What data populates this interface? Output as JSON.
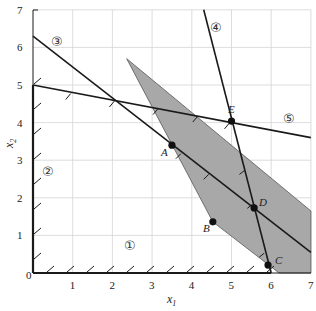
{
  "chart_data": {
    "type": "line",
    "title": "",
    "xlabel": "x",
    "xlabel_sub": "1",
    "ylabel": "x",
    "ylabel_sub": "2",
    "xlim": [
      0,
      7
    ],
    "ylim": [
      0,
      7
    ],
    "grid": true,
    "x_ticks": [
      "0",
      "1",
      "2",
      "3",
      "4",
      "5",
      "6",
      "7"
    ],
    "y_ticks": [
      "1",
      "2",
      "3",
      "4",
      "5",
      "6",
      "7"
    ],
    "constraints": [
      {
        "label": "①",
        "from": [
          0,
          0
        ],
        "to": [
          6,
          0
        ],
        "hatched_side": "above"
      },
      {
        "label": "②",
        "from": [
          0,
          0
        ],
        "to": [
          0,
          5
        ],
        "hatched_side": "right"
      },
      {
        "label": "③",
        "from": [
          0,
          6.3
        ],
        "to": [
          7,
          0.55
        ]
      },
      {
        "label": "④",
        "from": [
          4.3,
          7
        ],
        "to": [
          6,
          0
        ]
      },
      {
        "label": "⑤",
        "from": [
          0,
          5
        ],
        "to": [
          7,
          3.6
        ],
        "hatched_side": "below"
      }
    ],
    "shaded_region": [
      [
        2.36,
        5.7
      ],
      [
        7,
        1.65
      ],
      [
        7,
        0
      ],
      [
        6.2,
        0
      ],
      [
        4.53,
        1.36
      ]
    ],
    "points": [
      {
        "label": "A",
        "x": 3.5,
        "y": 3.4
      },
      {
        "label": "B",
        "x": 4.53,
        "y": 1.36
      },
      {
        "label": "C",
        "x": 5.92,
        "y": 0.21
      },
      {
        "label": "D",
        "x": 5.57,
        "y": 1.73
      },
      {
        "label": "E",
        "x": 5.0,
        "y": 4.04
      }
    ],
    "region_labels": [
      {
        "label": "①",
        "x": 2.5,
        "y": 0.6
      },
      {
        "label": "②",
        "x": 0.35,
        "y": 2.7
      },
      {
        "label": "③",
        "x": 0.65,
        "y": 6.1
      },
      {
        "label": "④",
        "x": 5.0,
        "y": 6.7
      },
      {
        "label": "⑤",
        "x": 6.4,
        "y": 4.0
      }
    ]
  },
  "labels": {
    "x_axis": "x",
    "x_axis_sub": "1",
    "y_axis": "x",
    "y_axis_sub": "2",
    "origin": "0",
    "point_a": "A",
    "point_b": "B",
    "point_c": "C",
    "point_d": "D",
    "point_e": "E",
    "c1": "①",
    "c2": "②",
    "c3": "③",
    "c4": "④",
    "c5": "⑤"
  }
}
